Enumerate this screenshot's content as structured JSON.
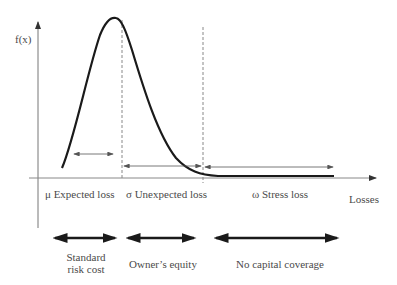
{
  "diagram": {
    "y_axis_label": "f(x)",
    "x_axis_label": "Losses",
    "regions": [
      {
        "symbol": "μ",
        "label": "μ Expected loss"
      },
      {
        "symbol": "σ",
        "label": "σ Unexpected loss"
      },
      {
        "symbol": "ω",
        "label": "ω Stress loss"
      }
    ],
    "coverage": [
      {
        "line1": "Standard",
        "line2": "risk cost"
      },
      {
        "line1": "Owner’s equity",
        "line2": ""
      },
      {
        "line1": "No capital coverage",
        "line2": ""
      }
    ],
    "colors": {
      "curve": "#1a1a1a",
      "axis": "#777777",
      "dashed": "#888888",
      "thin_arrow": "#555555",
      "thick_arrow": "#1a1a1a",
      "text": "#4a4a4a"
    }
  }
}
